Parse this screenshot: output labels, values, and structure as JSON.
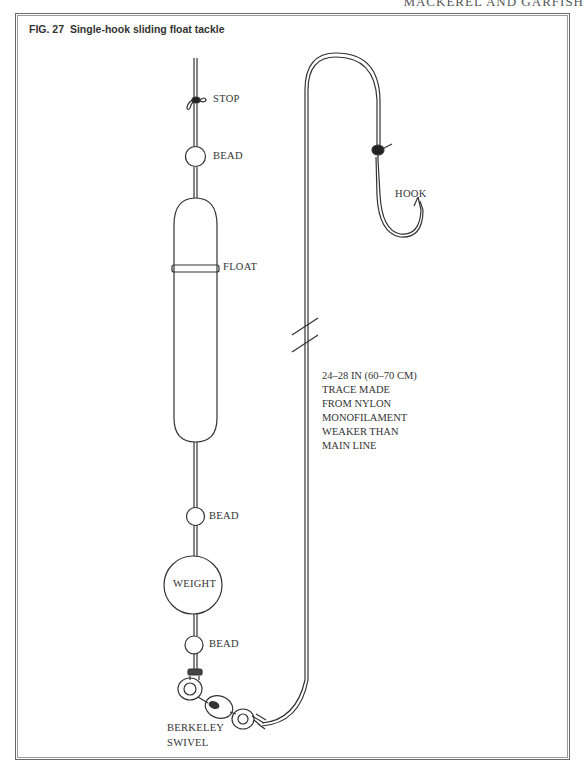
{
  "page": {
    "running_header": "MACKEREL AND GARFISH"
  },
  "figure": {
    "number": "FIG. 27",
    "title": "Single-hook sliding float tackle"
  },
  "labels": {
    "stop": "STOP",
    "bead_top": "BEAD",
    "float": "FLOAT",
    "bead_middle": "BEAD",
    "weight": "WEIGHT",
    "bead_bottom": "BEAD",
    "swivel_line1": "BERKELEY",
    "swivel_line2": "SWIVEL",
    "hook": "HOOK"
  },
  "trace_note": {
    "lines": [
      "24–28 IN (60–70 CM)",
      "TRACE MADE",
      "FROM NYLON",
      "MONOFILAMENT",
      "WEAKER THAN",
      "MAIN LINE"
    ]
  },
  "colors": {
    "line": "#333333",
    "frame": "#6a6a6a",
    "text": "#333333"
  }
}
